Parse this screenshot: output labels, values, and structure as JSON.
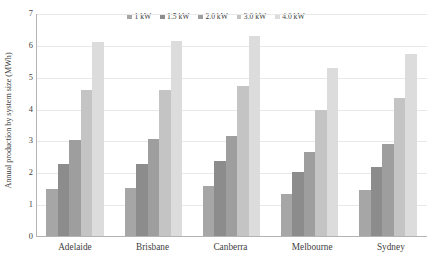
{
  "chart_data": {
    "type": "bar",
    "title": "",
    "subtitle": "",
    "xlabel": "",
    "ylabel": "Annual production by system size (MWh)",
    "ylim": [
      0,
      7
    ],
    "ytick_step": 1,
    "ytick_labels": [
      "7",
      "6",
      "5",
      "4",
      "3",
      "2",
      "1",
      "0"
    ],
    "grid": true,
    "grid_axis": "y",
    "legend_position": "top-center",
    "legend_orientation": "horizontal",
    "categories": [
      "Adelaide",
      "Brisbane",
      "Canberra",
      "Melbourne",
      "Sydney"
    ],
    "series": [
      {
        "name": "1 kW",
        "color": "#a6a6a6",
        "values": [
          1.52,
          1.55,
          1.6,
          1.35,
          1.49
        ]
      },
      {
        "name": "1.5 kW",
        "color": "#8c8c8c",
        "values": [
          2.28,
          2.3,
          2.38,
          2.03,
          2.2
        ]
      },
      {
        "name": "2.0 kW",
        "color": "#9e9e9e",
        "values": [
          3.05,
          3.07,
          3.17,
          2.67,
          2.92
        ]
      },
      {
        "name": "3.0 kW",
        "color": "#c4c4c4",
        "values": [
          4.6,
          4.62,
          4.75,
          4.0,
          4.35
        ]
      },
      {
        "name": "4.0 kW",
        "color": "#dcdcdc",
        "values": [
          6.13,
          6.14,
          6.3,
          5.31,
          5.75
        ]
      }
    ]
  },
  "axis": {
    "y_title": "Annual production by system size (MWh)"
  },
  "colors": {
    "gridline": "#e8e8e8",
    "axis_line": "#b4b4b4",
    "text": "#3f3f3f",
    "background": "#ffffff"
  }
}
